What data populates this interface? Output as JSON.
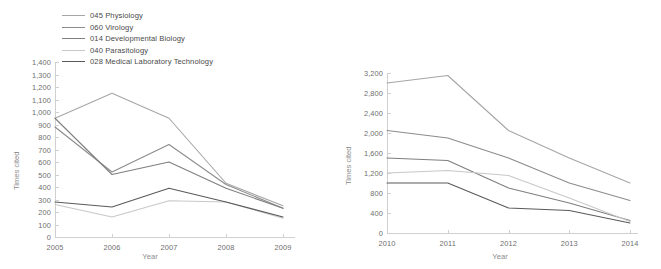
{
  "legend": {
    "items": [
      {
        "label": "045 Physiology",
        "color": "#a6a6a6"
      },
      {
        "label": "060 Virology",
        "color": "#8c8c8c"
      },
      {
        "label": "014 Developmental Biology",
        "color": "#7f7f7f"
      },
      {
        "label": "040 Parasitology",
        "color": "#c8c8c8"
      },
      {
        "label": "028 Medical Laboratory Technology",
        "color": "#5a5a5a"
      }
    ]
  },
  "chart_data": [
    {
      "type": "line",
      "title": "",
      "xlabel": "Year",
      "ylabel": "Times cited",
      "categories": [
        "2005",
        "2006",
        "2007",
        "2008",
        "2009"
      ],
      "x": [
        2005,
        2006,
        2007,
        2008,
        2009
      ],
      "ylim": [
        0,
        1400
      ],
      "ytick_step": 100,
      "yticks": [
        "0",
        "100",
        "200",
        "300",
        "400",
        "500",
        "600",
        "700",
        "800",
        "900",
        "1,000",
        "1,100",
        "1,200",
        "1,300",
        "1,400"
      ],
      "grid": false,
      "legend_position": "top",
      "series": [
        {
          "name": "045 Physiology",
          "color": "#a6a6a6",
          "values": [
            950,
            1150,
            950,
            430,
            250
          ]
        },
        {
          "name": "060 Virology",
          "color": "#8c8c8c",
          "values": [
            880,
            520,
            740,
            420,
            230
          ]
        },
        {
          "name": "014 Developmental Biology",
          "color": "#7f7f7f",
          "values": [
            950,
            500,
            600,
            390,
            230
          ]
        },
        {
          "name": "040 Parasitology",
          "color": "#c8c8c8",
          "values": [
            260,
            160,
            290,
            280,
            150
          ]
        },
        {
          "name": "028 Medical Laboratory Technology",
          "color": "#5a5a5a",
          "values": [
            280,
            240,
            390,
            280,
            160
          ]
        }
      ]
    },
    {
      "type": "line",
      "title": "",
      "xlabel": "Year",
      "ylabel": "Times cited",
      "categories": [
        "2010",
        "2011",
        "2012",
        "2013",
        "2014"
      ],
      "x": [
        2010,
        2011,
        2012,
        2013,
        2014
      ],
      "ylim": [
        0,
        3200
      ],
      "ytick_step": 400,
      "yticks": [
        "0",
        "400",
        "800",
        "1,200",
        "1,600",
        "2,000",
        "2,400",
        "2,800",
        "3,200"
      ],
      "grid": false,
      "legend_position": "none",
      "series": [
        {
          "name": "045 Physiology",
          "color": "#a6a6a6",
          "values": [
            3000,
            3150,
            2050,
            1500,
            1000
          ]
        },
        {
          "name": "060 Virology",
          "color": "#8c8c8c",
          "values": [
            2050,
            1900,
            1500,
            1000,
            650
          ]
        },
        {
          "name": "014 Developmental Biology",
          "color": "#7f7f7f",
          "values": [
            1500,
            1450,
            900,
            600,
            250
          ]
        },
        {
          "name": "040 Parasitology",
          "color": "#c8c8c8",
          "values": [
            1200,
            1250,
            1150,
            700,
            230
          ]
        },
        {
          "name": "028 Medical Laboratory Technology",
          "color": "#5a5a5a",
          "values": [
            1000,
            1000,
            500,
            450,
            200
          ]
        }
      ]
    }
  ]
}
